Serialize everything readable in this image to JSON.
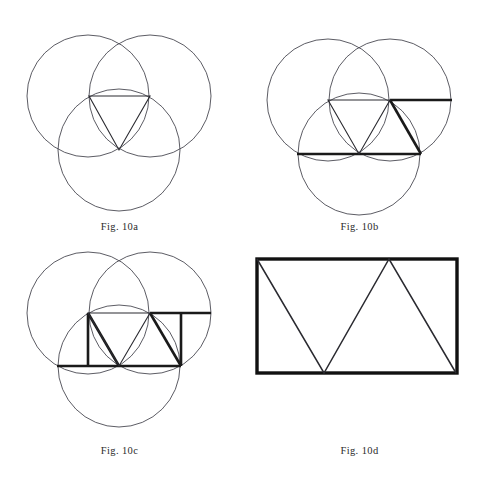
{
  "page": {
    "background_color": "#ffffff",
    "width": 479,
    "height": 480,
    "kind": "geometry-figure-plate"
  },
  "style": {
    "thin_stroke_color": "#4a4a52",
    "thin_stroke_width": 0.9,
    "medium_stroke_color": "#2a2a30",
    "medium_stroke_width": 1.1,
    "bold_stroke_color": "#1a1a1a",
    "bold_stroke_width": 2.6,
    "heavy_stroke_color": "#111111",
    "heavy_stroke_width": 3.4,
    "caption_color": "#2b2b2b"
  },
  "figures": [
    {
      "id": "fig-10a",
      "caption": "Fig. 10a",
      "description": "Three equal overlapping circles with an inscribed triangle",
      "circles": [
        {
          "name": "upper-left-circle",
          "cx": 88,
          "cy": 96,
          "r": 61
        },
        {
          "name": "upper-right-circle",
          "cx": 150,
          "cy": 96,
          "r": 61
        },
        {
          "name": "lower-circle",
          "cx": 119,
          "cy": 150,
          "r": 61
        }
      ],
      "triangle": {
        "name": "inscribed-triangle",
        "points": "89,96 150,96 119,150",
        "weight": "medium"
      },
      "bold_segments": [],
      "vertical_segments": []
    },
    {
      "id": "fig-10b",
      "caption": "Fig. 10b",
      "description": "Same three circles; inscribed triangle plus bold horizontal chords extended and a second triangle",
      "circles": [
        {
          "name": "upper-left-circle",
          "cx": 328,
          "cy": 100,
          "r": 61
        },
        {
          "name": "upper-right-circle",
          "cx": 390,
          "cy": 100,
          "r": 61
        },
        {
          "name": "lower-circle",
          "cx": 359,
          "cy": 154,
          "r": 61
        }
      ],
      "triangle": {
        "name": "inscribed-triangle",
        "points": "328,100 390,100 359,154",
        "weight": "medium"
      },
      "bold_segments": [
        {
          "name": "top-chord-extended",
          "x1": 390,
          "y1": 100,
          "x2": 452,
          "y2": 100
        },
        {
          "name": "bottom-chord-left",
          "x1": 297,
          "y1": 154,
          "x2": 359,
          "y2": 154
        },
        {
          "name": "bottom-chord-right",
          "x1": 359,
          "y1": 154,
          "x2": 421,
          "y2": 154
        },
        {
          "name": "right-triangle-side",
          "x1": 390,
          "y1": 100,
          "x2": 421,
          "y2": 154
        }
      ],
      "vertical_segments": []
    },
    {
      "id": "fig-10c",
      "caption": "Fig. 10c",
      "description": "Same three circles; rectangle closed by two vertical sides enclosing two triangles",
      "circles": [
        {
          "name": "upper-left-circle",
          "cx": 88,
          "cy": 313,
          "r": 61
        },
        {
          "name": "upper-right-circle",
          "cx": 150,
          "cy": 313,
          "r": 61
        },
        {
          "name": "lower-circle",
          "cx": 119,
          "cy": 366,
          "r": 61
        }
      ],
      "triangle": {
        "name": "inscribed-triangle",
        "points": "88,313 150,313 119,366",
        "weight": "medium"
      },
      "bold_segments": [
        {
          "name": "top-chord-extended",
          "x1": 150,
          "y1": 313,
          "x2": 211,
          "y2": 313
        },
        {
          "name": "bottom-chord-left",
          "x1": 57,
          "y1": 366,
          "x2": 119,
          "y2": 366
        },
        {
          "name": "bottom-chord-right",
          "x1": 119,
          "y1": 366,
          "x2": 181,
          "y2": 366
        },
        {
          "name": "right-triangle-side",
          "x1": 150,
          "y1": 313,
          "x2": 181,
          "y2": 366
        },
        {
          "name": "left-triangle-side",
          "x1": 88,
          "y1": 313,
          "x2": 119,
          "y2": 366
        }
      ],
      "vertical_segments": [
        {
          "name": "left-vertical-side",
          "x1": 88,
          "y1": 313,
          "x2": 88,
          "y2": 366
        },
        {
          "name": "right-vertical-side",
          "x1": 181,
          "y1": 313,
          "x2": 181,
          "y2": 366
        }
      ]
    },
    {
      "id": "fig-10d",
      "caption": "Fig. 10d",
      "description": "Heavy-outlined rectangle containing a zigzag forming two triangles",
      "circles": [],
      "rectangle": {
        "name": "outer-rectangle",
        "x": 257,
        "y": 259,
        "width": 200,
        "height": 114
      },
      "zigzag": {
        "name": "zigzag-polyline",
        "points": "257,259 324,373 389,259 456,373"
      },
      "bold_segments": [],
      "vertical_segments": []
    }
  ]
}
